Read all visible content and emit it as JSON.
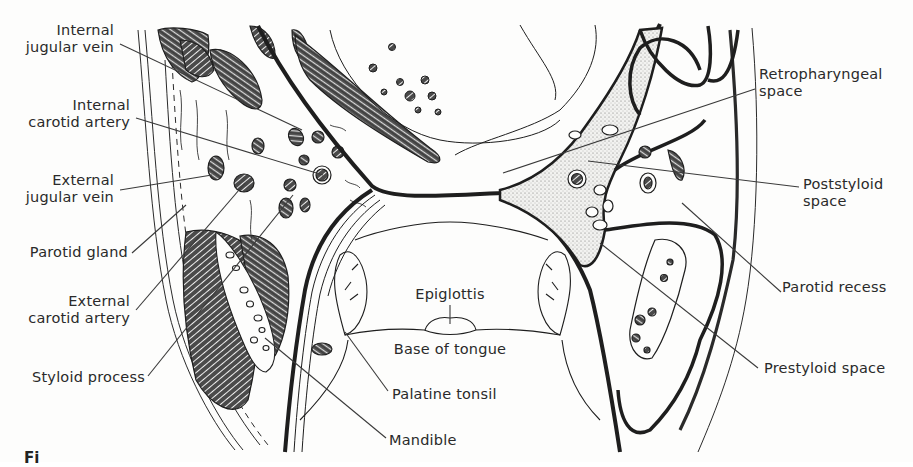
{
  "figure": {
    "type": "anatomical cross-section diagram",
    "caption_partial": "Fi",
    "colors": {
      "ink": "#1e1e1e",
      "paper": "#fdfdfc",
      "stipple": "#8a8a8a",
      "leader": "#3a3a3a"
    }
  },
  "labels": {
    "left": [
      {
        "id": "internal-jugular-vein",
        "lines": [
          "Internal",
          "jugular vein"
        ],
        "x": 114,
        "y": 22,
        "anchor": "right"
      },
      {
        "id": "internal-carotid-artery",
        "lines": [
          "Internal",
          "carotid artery"
        ],
        "x": 130,
        "y": 97,
        "anchor": "right"
      },
      {
        "id": "external-jugular-vein",
        "lines": [
          "External",
          "jugular vein"
        ],
        "x": 114,
        "y": 172,
        "anchor": "right"
      },
      {
        "id": "parotid-gland",
        "lines": [
          "Parotid gland"
        ],
        "x": 128,
        "y": 244,
        "anchor": "right"
      },
      {
        "id": "external-carotid-artery",
        "lines": [
          "External",
          "carotid artery"
        ],
        "x": 130,
        "y": 293,
        "anchor": "right"
      },
      {
        "id": "styloid-process",
        "lines": [
          "Styloid process"
        ],
        "x": 145,
        "y": 370,
        "anchor": "right"
      }
    ],
    "right": [
      {
        "id": "retropharyngeal-space",
        "lines": [
          "Retropharyngeal",
          "space"
        ],
        "x": 758,
        "y": 67,
        "anchor": "left"
      },
      {
        "id": "poststyloid-space",
        "lines": [
          "Poststyloid",
          "space"
        ],
        "x": 803,
        "y": 176,
        "anchor": "left"
      },
      {
        "id": "parotid-recess",
        "lines": [
          "Parotid recess"
        ],
        "x": 780,
        "y": 278,
        "anchor": "left"
      },
      {
        "id": "prestyloid-space",
        "lines": [
          "Prestyloid space"
        ],
        "x": 762,
        "y": 360,
        "anchor": "left"
      }
    ],
    "center": [
      {
        "id": "epiglottis",
        "lines": [
          "Epiglottis"
        ],
        "x": 450,
        "y": 285,
        "anchor": "center"
      },
      {
        "id": "base-of-tongue",
        "lines": [
          "Base of tongue"
        ],
        "x": 450,
        "y": 340,
        "anchor": "center"
      },
      {
        "id": "palatine-tonsil",
        "lines": [
          "Palatine tonsil"
        ],
        "x": 392,
        "y": 385,
        "anchor": "left"
      },
      {
        "id": "mandible",
        "lines": [
          "Mandible"
        ],
        "x": 389,
        "y": 432,
        "anchor": "left"
      }
    ]
  },
  "leaders": [
    {
      "for": "internal-jugular-vein",
      "x1": 120,
      "y1": 44,
      "x2": 302,
      "y2": 130
    },
    {
      "for": "internal-carotid-artery",
      "x1": 136,
      "y1": 118,
      "x2": 323,
      "y2": 175
    },
    {
      "for": "external-jugular-vein",
      "x1": 120,
      "y1": 190,
      "x2": 212,
      "y2": 175
    },
    {
      "for": "parotid-gland",
      "x1": 132,
      "y1": 253,
      "x2": 186,
      "y2": 205
    },
    {
      "for": "external-carotid-artery",
      "x1": 136,
      "y1": 310,
      "x2": 245,
      "y2": 183
    },
    {
      "for": "styloid-process",
      "x1": 148,
      "y1": 376,
      "x2": 293,
      "y2": 195
    },
    {
      "for": "retropharyngeal-space",
      "x1": 755,
      "y1": 89,
      "x2": 503,
      "y2": 173
    },
    {
      "for": "poststyloid-space",
      "x1": 799,
      "y1": 187,
      "x2": 588,
      "y2": 161
    },
    {
      "for": "parotid-recess",
      "x1": 781,
      "y1": 292,
      "x2": 682,
      "y2": 203
    },
    {
      "for": "prestyloid-space",
      "x1": 758,
      "y1": 368,
      "x2": 600,
      "y2": 243
    },
    {
      "for": "epiglottis",
      "x1": 450,
      "y1": 305,
      "x2": 450,
      "y2": 324
    },
    {
      "for": "palatine-tonsil",
      "x1": 388,
      "y1": 391,
      "x2": 345,
      "y2": 332
    },
    {
      "for": "mandible",
      "x1": 386,
      "y1": 438,
      "x2": 265,
      "y2": 338
    }
  ]
}
